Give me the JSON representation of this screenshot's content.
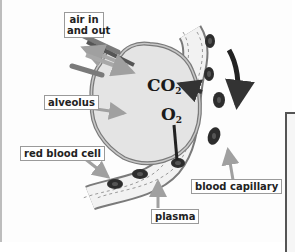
{
  "diagram": {
    "labels": {
      "air": {
        "line1": "air in",
        "line2": "and out"
      },
      "alveolus": "alveolus",
      "red_blood_cell": "red blood cell",
      "blood_capillary": "blood capillary",
      "plasma": "plasma"
    },
    "gases": {
      "co2": {
        "base": "CO",
        "sub": "2"
      },
      "o2": {
        "base": "O",
        "sub": "2"
      }
    },
    "colors": {
      "alveolus_fill": "#e4e4e4",
      "wall": "#7a7a7a",
      "capillary_fill": "#f2f2f2",
      "cell": "#2d2d2d",
      "arrow_dark": "#333333",
      "arrow_light": "#a8a8a8",
      "label_border": "#9a9a9a"
    }
  }
}
